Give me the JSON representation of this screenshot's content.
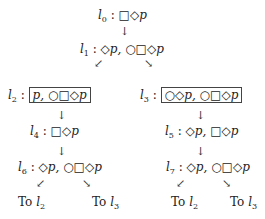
{
  "diagram": {
    "nodes": [
      {
        "id": "l0",
        "label": "l",
        "sub": "0",
        "formula": "□◇p",
        "boxed": false
      },
      {
        "id": "l1",
        "label": "l",
        "sub": "1",
        "formula": "◇p, ○□◇p",
        "boxed": false
      },
      {
        "id": "l2",
        "label": "l",
        "sub": "2",
        "formula": "p, ○□◇p",
        "boxed": true
      },
      {
        "id": "l3",
        "label": "l",
        "sub": "3",
        "formula": "○◇p, ○□◇p",
        "boxed": true
      },
      {
        "id": "l4",
        "label": "l",
        "sub": "4",
        "formula": "□◇p",
        "boxed": false
      },
      {
        "id": "l5",
        "label": "l",
        "sub": "5",
        "formula": "◇p, □◇p",
        "boxed": false
      },
      {
        "id": "l6",
        "label": "l",
        "sub": "6",
        "formula": "◇p, ○□◇p",
        "boxed": false
      },
      {
        "id": "l7",
        "label": "l",
        "sub": "7",
        "formula": "◇p, ○□◇p",
        "boxed": false
      }
    ],
    "edges": [
      {
        "from": "l0",
        "to": "l1"
      },
      {
        "from": "l1",
        "to": "l2"
      },
      {
        "from": "l1",
        "to": "l3"
      },
      {
        "from": "l2",
        "to": "l4"
      },
      {
        "from": "l3",
        "to": "l5"
      },
      {
        "from": "l4",
        "to": "l6"
      },
      {
        "from": "l5",
        "to": "l7"
      },
      {
        "from": "l6",
        "to": "l2"
      },
      {
        "from": "l6",
        "to": "l3"
      },
      {
        "from": "l7",
        "to": "l2"
      },
      {
        "from": "l7",
        "to": "l3"
      }
    ],
    "goto_prefix": "To",
    "goto": [
      {
        "label": "l",
        "sub": "2"
      },
      {
        "label": "l",
        "sub": "3"
      },
      {
        "label": "l",
        "sub": "2"
      },
      {
        "label": "l",
        "sub": "3"
      }
    ],
    "separator": " : ",
    "arrows": {
      "down": "↓",
      "down_left": "↙",
      "down_right": "↘"
    }
  }
}
